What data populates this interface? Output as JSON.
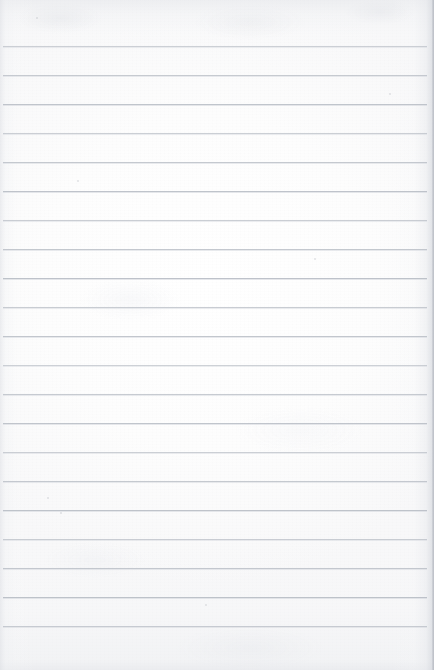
{
  "document": {
    "kind": "scanned-blank-lined-paper",
    "page_width": 434,
    "page_height": 670,
    "paper_color": "#fcfcfc",
    "has_visible_text": false,
    "text_content": ""
  },
  "ruling": {
    "line_color": "#b9bec6",
    "line_thickness_px": 1,
    "line_count": 21,
    "first_line_y": 46,
    "line_spacing_px": 29,
    "line_left_x": 3,
    "line_right_x": 427,
    "top_margin_px": 46,
    "bottom_margin_px": 44,
    "lines_y": [
      46,
      75,
      104,
      133,
      162,
      191,
      220,
      249,
      278,
      307,
      336,
      365,
      394,
      423,
      452,
      481,
      510,
      539,
      568,
      597,
      626
    ]
  },
  "specks": [
    {
      "x": 36,
      "y": 17,
      "size": 2
    },
    {
      "x": 77,
      "y": 180,
      "size": 2
    },
    {
      "x": 47,
      "y": 497,
      "size": 2
    },
    {
      "x": 60,
      "y": 512,
      "size": 2
    },
    {
      "x": 314,
      "y": 258,
      "size": 2
    },
    {
      "x": 205,
      "y": 604,
      "size": 2
    },
    {
      "x": 389,
      "y": 93,
      "size": 2
    }
  ],
  "edges": {
    "right_edge_shadow": "#b0b4bc",
    "left_edge_shadow": "#dee0e5",
    "top_edge_shade": "#e2e4e8",
    "bottom_edge_shade": "#e0e2e7"
  }
}
